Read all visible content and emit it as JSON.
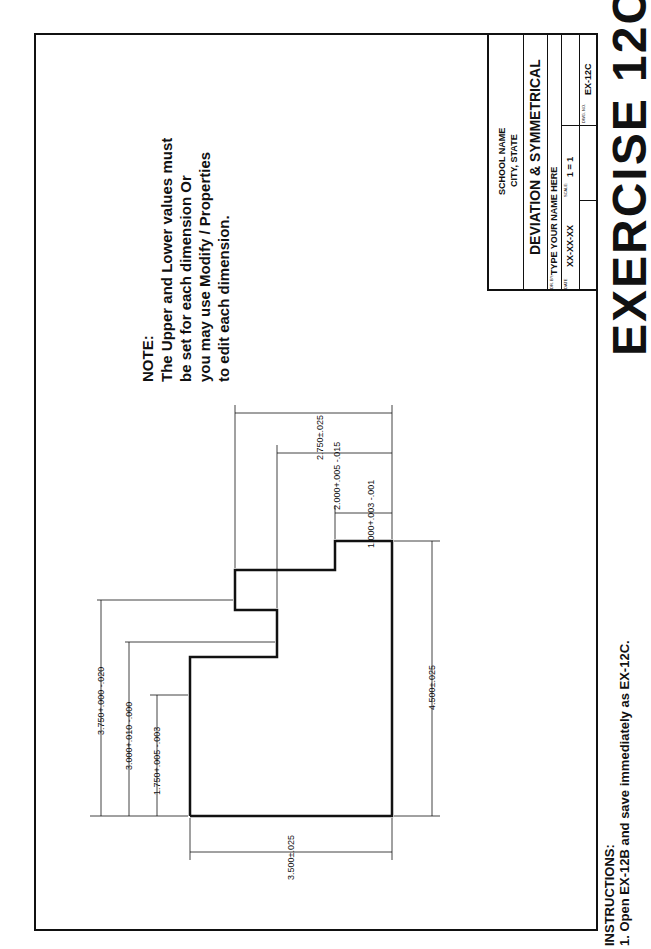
{
  "page_title": "EXERCISE 12C",
  "note": {
    "heading": "NOTE:",
    "lines": [
      "The Upper and Lower values must",
      "be set for each dimension Or",
      "you may use Modify / Properties",
      "to edit each dimension."
    ]
  },
  "title_block": {
    "school": "SCHOOL NAME",
    "city": "CITY, STATE",
    "drawing_title": "DEVIATION & SYMMETRICAL",
    "drawn_by_label": "DR. BY:",
    "drawn_by": "TYPE YOUR NAME HERE",
    "date_label": "DATE",
    "date": "XX-XX-XX",
    "scale_label": "SCALE:",
    "scale": "1 = 1",
    "dwg_no_label": "DWG. NO.",
    "dwg_no": "EX-12C"
  },
  "dimensions": {
    "d1": "3.750+.000 -.020",
    "d2": "3.000+.010 -.000",
    "d3": "1.750+.005 -.003",
    "d4": "3.500±.025",
    "d5": "4.500±.025",
    "d6": "2.750±.025",
    "d7": "2.000+.005 -.015",
    "d8": "1.000+.003 -.001"
  },
  "instructions": {
    "heading": "INSTRUCTIONS:",
    "step1": "1. Open EX-12B and save immediately as EX-12C."
  }
}
